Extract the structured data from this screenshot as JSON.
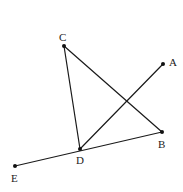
{
  "diagram": {
    "type": "geometry",
    "width": 183,
    "height": 192,
    "stroke_color": "#1a1a1a",
    "points": {
      "A": {
        "x": 163,
        "y": 64,
        "label": "A",
        "label_x": 169,
        "label_y": 66
      },
      "B": {
        "x": 162,
        "y": 132,
        "label": "B",
        "label_x": 158,
        "label_y": 148
      },
      "C": {
        "x": 64,
        "y": 46,
        "label": "C",
        "label_x": 59,
        "label_y": 41
      },
      "D": {
        "x": 80,
        "y": 149,
        "label": "D",
        "label_x": 76,
        "label_y": 164
      },
      "E": {
        "x": 15,
        "y": 166,
        "label": "E",
        "label_x": 11,
        "label_y": 182
      }
    },
    "segments": [
      {
        "from": "C",
        "to": "D",
        "name": "CD"
      },
      {
        "from": "C",
        "to": "B",
        "name": "CB"
      },
      {
        "from": "D",
        "to": "A",
        "name": "DA"
      },
      {
        "from": "E",
        "to": "B",
        "name": "EB"
      }
    ],
    "labels": [
      "A",
      "B",
      "C",
      "D",
      "E"
    ]
  }
}
